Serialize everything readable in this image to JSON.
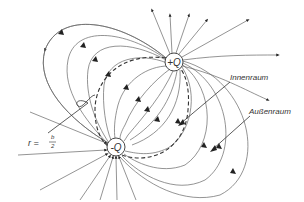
{
  "diagram": {
    "type": "electric field lines of a dipole",
    "charges": [
      {
        "label": "+Q",
        "x": 174,
        "y": 62
      },
      {
        "label": "-Q",
        "x": 116,
        "y": 147
      }
    ],
    "labels": {
      "inner": "Innenraum",
      "outer": "Außenraum",
      "radius_lhs": "r =",
      "radius_num": "b",
      "radius_den": "2"
    },
    "colors": {
      "line": "#666666",
      "dash": "#333333",
      "text": "#333333"
    }
  }
}
